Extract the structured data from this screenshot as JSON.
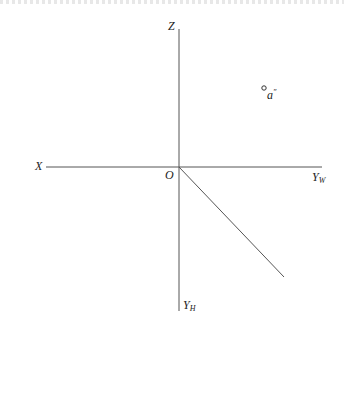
{
  "diagram": {
    "type": "three-plane projection axes",
    "colors": {
      "line": "#555555",
      "text": "#222222",
      "background": "#ffffff"
    },
    "origin": {
      "label": "O",
      "x": 179,
      "y": 167
    },
    "axes": [
      {
        "id": "x",
        "label": "X",
        "from": [
          46,
          167
        ],
        "to": [
          179,
          167
        ]
      },
      {
        "id": "z",
        "label": "Z",
        "from": [
          179,
          29
        ],
        "to": [
          179,
          167
        ]
      },
      {
        "id": "yw",
        "label": "Y",
        "subscript": "W",
        "from": [
          179,
          167
        ],
        "to": [
          322,
          167
        ]
      },
      {
        "id": "yh",
        "label": "Y",
        "subscript": "H",
        "from": [
          179,
          167
        ],
        "to": [
          179,
          311
        ]
      },
      {
        "id": "diagonal-45",
        "label": "",
        "from": [
          179,
          167
        ],
        "to": [
          284,
          277
        ]
      }
    ],
    "points": [
      {
        "id": "a-double-prime",
        "label": "a",
        "prime": "″",
        "x": 264,
        "y": 88
      }
    ]
  }
}
